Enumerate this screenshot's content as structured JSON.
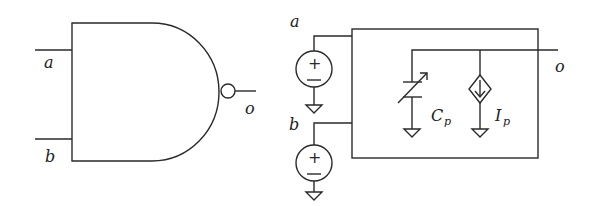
{
  "left_gate": {
    "type": "NAND gate",
    "inputs": [
      {
        "label": "a"
      },
      {
        "label": "b"
      }
    ],
    "output": {
      "label": "o"
    }
  },
  "right_circuit": {
    "type": "equivalent circuit model",
    "sources": [
      {
        "label": "a",
        "plus": "+",
        "minus": "−"
      },
      {
        "label": "b",
        "plus": "+",
        "minus": "−"
      }
    ],
    "capacitor": {
      "label_main": "C",
      "label_sub": "p",
      "kind": "variable capacitor"
    },
    "current_source": {
      "label_main": "I",
      "label_sub": "p",
      "kind": "dependent current source"
    },
    "output": {
      "label": "o"
    }
  },
  "colors": {
    "stroke": "#2a2a2a",
    "background": "#ffffff"
  }
}
